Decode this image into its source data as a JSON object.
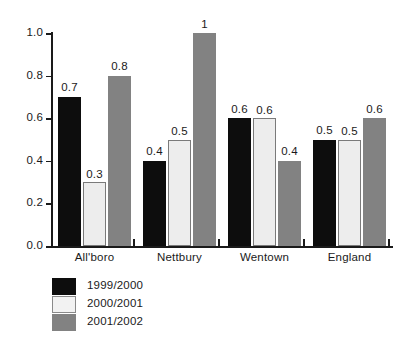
{
  "chart_data": {
    "type": "bar",
    "title": "",
    "subtitle": "",
    "xlabel": "",
    "ylabel": "",
    "ylim": [
      0,
      1.0
    ],
    "yticks": [
      "0.0",
      "0.2",
      "0.4",
      "0.6",
      "0.8",
      "1.0"
    ],
    "ytick_values": [
      0,
      0.2,
      0.4,
      0.6,
      0.8,
      1.0
    ],
    "grid": false,
    "legend_position": "bottom-left",
    "categories": [
      "All'boro",
      "Nettbury",
      "Wentown",
      "England"
    ],
    "series": [
      {
        "name": "1999/2000",
        "color": "#0d0d0d",
        "values": [
          0.7,
          0.4,
          0.6,
          0.5
        ],
        "labels": [
          "0.7",
          "0.4",
          "0.6",
          "0.5"
        ]
      },
      {
        "name": "2000/2001",
        "color": "#ededed",
        "values": [
          0.3,
          0.5,
          0.6,
          0.5
        ],
        "labels": [
          "0.3",
          "0.5",
          "0.6",
          "0.5"
        ]
      },
      {
        "name": "2001/2002",
        "color": "#828282",
        "values": [
          0.8,
          1.0,
          0.4,
          0.6
        ],
        "labels": [
          "0.8",
          "1",
          "0.4",
          "0.6"
        ]
      }
    ]
  },
  "legend": {
    "items": [
      {
        "label": "1999/2000"
      },
      {
        "label": "2000/2001"
      },
      {
        "label": "2001/2002"
      }
    ]
  }
}
